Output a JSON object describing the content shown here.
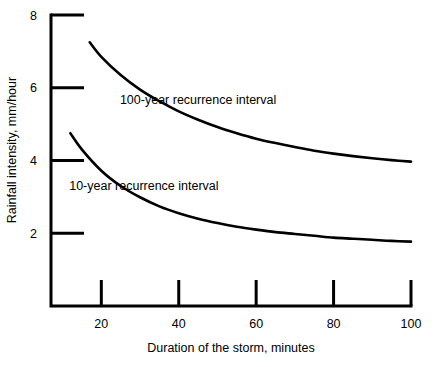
{
  "chart_data": {
    "type": "line",
    "title": "",
    "subtitle": "",
    "xlabel": "Duration of the storm, minutes",
    "ylabel": "Rainfall intensity, mm/hour",
    "xlim": [
      7,
      100
    ],
    "ylim": [
      0,
      8
    ],
    "xticks": [
      20,
      40,
      60,
      80,
      100
    ],
    "yticks": [
      2,
      4,
      6,
      8
    ],
    "xtick_labels": [
      "20",
      "40",
      "60",
      "80",
      "100"
    ],
    "ytick_labels": [
      "2",
      "4",
      "6",
      "8"
    ],
    "grid": false,
    "legend_position": "inline-annotation",
    "line_color": "#000000",
    "axis_color": "#000000",
    "background_color": "#ffffff",
    "series": [
      {
        "name": "100-year recurrence interval",
        "label_x": 45,
        "label_y": 5.55,
        "x": [
          17,
          20,
          25,
          30,
          35,
          40,
          45,
          50,
          55,
          60,
          65,
          70,
          75,
          80,
          85,
          90,
          95,
          100
        ],
        "values": [
          7.25,
          6.85,
          6.35,
          5.95,
          5.63,
          5.35,
          5.12,
          4.92,
          4.75,
          4.6,
          4.48,
          4.37,
          4.27,
          4.19,
          4.12,
          4.06,
          4.01,
          3.97
        ]
      },
      {
        "name": "10-year recurrence interval",
        "label_x": 31,
        "label_y": 3.2,
        "x": [
          12,
          15,
          20,
          25,
          30,
          35,
          40,
          45,
          50,
          55,
          60,
          65,
          70,
          75,
          80,
          85,
          90,
          95,
          100
        ],
        "values": [
          4.75,
          4.3,
          3.72,
          3.3,
          2.99,
          2.74,
          2.55,
          2.4,
          2.28,
          2.18,
          2.1,
          2.03,
          1.98,
          1.93,
          1.88,
          1.85,
          1.82,
          1.79,
          1.77
        ]
      }
    ]
  }
}
